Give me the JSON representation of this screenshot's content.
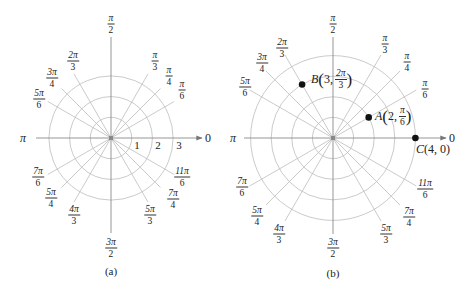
{
  "figure": {
    "panels": [
      {
        "id": "a",
        "caption": "(a)",
        "center": [
          111,
          138
        ],
        "ring_spacing": 20.7,
        "rings": [
          1,
          2,
          3
        ],
        "ring_labels": [
          "1",
          "2",
          "3"
        ],
        "zero_label": "0",
        "pi_label": "π",
        "angle_labels": [
          {
            "angle": "π/6",
            "num": "π",
            "den": "6"
          },
          {
            "angle": "π/4",
            "num": "π",
            "den": "4"
          },
          {
            "angle": "π/3",
            "num": "π",
            "den": "3"
          },
          {
            "angle": "π/2",
            "num": "π",
            "den": "2"
          },
          {
            "angle": "2π/3",
            "num": "2π",
            "den": "3"
          },
          {
            "angle": "3π/4",
            "num": "3π",
            "den": "4"
          },
          {
            "angle": "5π/6",
            "num": "5π",
            "den": "6"
          },
          {
            "angle": "7π/6",
            "num": "7π",
            "den": "6"
          },
          {
            "angle": "5π/4",
            "num": "5π",
            "den": "4"
          },
          {
            "angle": "4π/3",
            "num": "4π",
            "den": "3"
          },
          {
            "angle": "3π/2",
            "num": "3π",
            "den": "2"
          },
          {
            "angle": "5π/3",
            "num": "5π",
            "den": "3"
          },
          {
            "angle": "7π/4",
            "num": "7π",
            "den": "4"
          },
          {
            "angle": "11π/6",
            "num": "11π",
            "den": "6"
          }
        ]
      },
      {
        "id": "b",
        "caption": "(b)",
        "center": [
          333,
          138
        ],
        "ring_spacing": 20.6,
        "rings": [
          1,
          2,
          3,
          4
        ],
        "zero_label": "0",
        "pi_label": "π",
        "angle_labels": [
          {
            "angle": "π/6",
            "num": "π",
            "den": "6"
          },
          {
            "angle": "π/4",
            "num": "π",
            "den": "4"
          },
          {
            "angle": "π/3",
            "num": "π",
            "den": "3"
          },
          {
            "angle": "π/2",
            "num": "π",
            "den": "2"
          },
          {
            "angle": "2π/3",
            "num": "2π",
            "den": "3"
          },
          {
            "angle": "3π/4",
            "num": "3π",
            "den": "4"
          },
          {
            "angle": "5π/6",
            "num": "5π",
            "den": "6"
          },
          {
            "angle": "7π/6",
            "num": "7π",
            "den": "6"
          },
          {
            "angle": "5π/4",
            "num": "5π",
            "den": "4"
          },
          {
            "angle": "4π/3",
            "num": "4π",
            "den": "3"
          },
          {
            "angle": "3π/2",
            "num": "3π",
            "den": "2"
          },
          {
            "angle": "5π/3",
            "num": "5π",
            "den": "3"
          },
          {
            "angle": "7π/4",
            "num": "7π",
            "den": "4"
          },
          {
            "angle": "11π/6",
            "num": "11π",
            "den": "6"
          }
        ],
        "points": [
          {
            "name": "A",
            "r": 2,
            "theta": "π/6",
            "coord_r": "2",
            "theta_num": "π",
            "theta_den": "6"
          },
          {
            "name": "B",
            "r": 3,
            "theta": "2π/3",
            "coord_r": "3",
            "theta_num": "2π",
            "theta_den": "3"
          },
          {
            "name": "C",
            "r": 4,
            "theta": "0",
            "text": "(4, 0)"
          }
        ]
      }
    ],
    "colors": {
      "grid": "#b0b0b0",
      "axis": "#8a8a8a",
      "point": "#111111",
      "text": "#222222"
    }
  }
}
